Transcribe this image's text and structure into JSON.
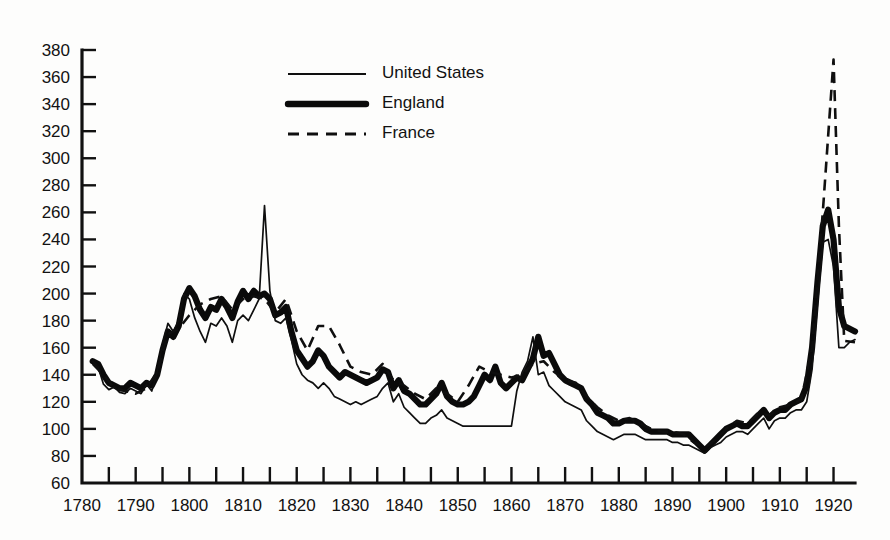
{
  "chart_data": {
    "type": "line",
    "title": "",
    "subtitle": "",
    "xlabel": "",
    "ylabel": "",
    "xlim": [
      1780,
      1924
    ],
    "ylim": [
      60,
      380
    ],
    "ytick_step": 20,
    "xtick_minor_step": 5,
    "xtick_major_step": 10,
    "grid": false,
    "legend_position": "top-center",
    "ytick_labels": [
      "380",
      "360",
      "340",
      "320",
      "300",
      "280",
      "260",
      "240",
      "220",
      "200",
      "180",
      "160",
      "140",
      "120",
      "100",
      "80",
      "60"
    ],
    "ytick_values": [
      380,
      360,
      340,
      320,
      300,
      280,
      260,
      240,
      220,
      200,
      180,
      160,
      140,
      120,
      100,
      80,
      60
    ],
    "xtick_labels": [
      "1780",
      "1790",
      "1800",
      "1810",
      "1820",
      "1830",
      "1840",
      "1850",
      "1860",
      "1870",
      "1880",
      "1890",
      "1900",
      "1910",
      "1920"
    ],
    "xtick_values": [
      1780,
      1790,
      1800,
      1810,
      1820,
      1830,
      1840,
      1850,
      1860,
      1870,
      1880,
      1890,
      1900,
      1910,
      1920
    ],
    "xtick_minor_values": [
      1785,
      1795,
      1805,
      1815,
      1825,
      1835,
      1845,
      1855,
      1865,
      1875,
      1885,
      1895,
      1905,
      1915
    ],
    "series": [
      {
        "name": "United States",
        "style": "thin-solid",
        "color": "#0f0f0f",
        "x": [
          1782,
          1783,
          1784,
          1785,
          1786,
          1787,
          1788,
          1789,
          1790,
          1791,
          1792,
          1793,
          1794,
          1795,
          1796,
          1797,
          1798,
          1799,
          1800,
          1801,
          1802,
          1803,
          1804,
          1805,
          1806,
          1807,
          1808,
          1809,
          1810,
          1811,
          1812,
          1813,
          1814,
          1815,
          1816,
          1817,
          1818,
          1819,
          1820,
          1821,
          1822,
          1823,
          1824,
          1825,
          1826,
          1827,
          1828,
          1829,
          1830,
          1831,
          1832,
          1833,
          1834,
          1835,
          1836,
          1837,
          1838,
          1839,
          1840,
          1841,
          1842,
          1843,
          1844,
          1845,
          1846,
          1847,
          1848,
          1849,
          1850,
          1851,
          1852,
          1853,
          1854,
          1855,
          1856,
          1857,
          1858,
          1859,
          1860,
          1861,
          1862,
          1863,
          1864,
          1865,
          1866,
          1867,
          1868,
          1869,
          1870,
          1871,
          1872,
          1873,
          1874,
          1875,
          1876,
          1877,
          1878,
          1879,
          1880,
          1881,
          1882,
          1883,
          1884,
          1885,
          1886,
          1887,
          1888,
          1889,
          1890,
          1891,
          1892,
          1893,
          1894,
          1895,
          1896,
          1897,
          1898,
          1899,
          1900,
          1901,
          1902,
          1903,
          1904,
          1905,
          1906,
          1907,
          1908,
          1909,
          1910,
          1911,
          1912,
          1913,
          1914,
          1915,
          1916,
          1917,
          1918,
          1919,
          1920,
          1921,
          1922,
          1923,
          1924
        ],
        "y": [
          150,
          146,
          133,
          129,
          131,
          127,
          126,
          130,
          128,
          126,
          133,
          128,
          142,
          162,
          178,
          172,
          180,
          200,
          196,
          182,
          172,
          164,
          178,
          176,
          182,
          176,
          164,
          180,
          184,
          180,
          188,
          196,
          265,
          202,
          180,
          178,
          182,
          166,
          148,
          140,
          136,
          134,
          130,
          134,
          130,
          124,
          122,
          120,
          118,
          120,
          118,
          120,
          122,
          124,
          130,
          134,
          120,
          126,
          116,
          112,
          108,
          104,
          104,
          108,
          110,
          114,
          108,
          106,
          104,
          102,
          102,
          102,
          102,
          102,
          102,
          102,
          102,
          102,
          102,
          128,
          142,
          150,
          168,
          140,
          142,
          132,
          128,
          124,
          120,
          118,
          116,
          114,
          106,
          102,
          98,
          96,
          94,
          92,
          94,
          96,
          96,
          96,
          94,
          92,
          92,
          92,
          92,
          92,
          90,
          90,
          88,
          88,
          86,
          84,
          82,
          86,
          88,
          90,
          94,
          96,
          98,
          98,
          96,
          100,
          104,
          108,
          100,
          106,
          108,
          108,
          112,
          114,
          114,
          120,
          144,
          192,
          238,
          240,
          220,
          160,
          160,
          164,
          166
        ]
      },
      {
        "name": "England",
        "style": "thick-solid",
        "color": "#0a0a0a",
        "x": [
          1782,
          1783,
          1784,
          1785,
          1786,
          1787,
          1788,
          1789,
          1790,
          1791,
          1792,
          1793,
          1794,
          1795,
          1796,
          1797,
          1798,
          1799,
          1800,
          1801,
          1802,
          1803,
          1804,
          1805,
          1806,
          1807,
          1808,
          1809,
          1810,
          1811,
          1812,
          1813,
          1814,
          1815,
          1816,
          1817,
          1818,
          1819,
          1820,
          1821,
          1822,
          1823,
          1824,
          1825,
          1826,
          1827,
          1828,
          1829,
          1830,
          1831,
          1832,
          1833,
          1834,
          1835,
          1836,
          1837,
          1838,
          1839,
          1840,
          1841,
          1842,
          1843,
          1844,
          1845,
          1846,
          1847,
          1848,
          1849,
          1850,
          1851,
          1852,
          1853,
          1854,
          1855,
          1856,
          1857,
          1858,
          1859,
          1860,
          1861,
          1862,
          1863,
          1864,
          1865,
          1866,
          1867,
          1868,
          1869,
          1870,
          1871,
          1872,
          1873,
          1874,
          1875,
          1876,
          1877,
          1878,
          1879,
          1880,
          1881,
          1882,
          1883,
          1884,
          1885,
          1886,
          1887,
          1888,
          1889,
          1890,
          1891,
          1892,
          1893,
          1894,
          1895,
          1896,
          1897,
          1898,
          1899,
          1900,
          1901,
          1902,
          1903,
          1904,
          1905,
          1906,
          1907,
          1908,
          1909,
          1910,
          1911,
          1912,
          1913,
          1914,
          1915,
          1916,
          1917,
          1918,
          1919,
          1920,
          1921,
          1922,
          1923,
          1924
        ],
        "y": [
          150,
          148,
          140,
          134,
          132,
          130,
          130,
          134,
          132,
          130,
          134,
          132,
          140,
          158,
          172,
          168,
          176,
          196,
          204,
          198,
          188,
          182,
          190,
          188,
          196,
          190,
          182,
          194,
          202,
          196,
          202,
          198,
          200,
          196,
          184,
          186,
          190,
          172,
          158,
          152,
          146,
          150,
          158,
          154,
          146,
          142,
          138,
          142,
          140,
          138,
          136,
          134,
          136,
          138,
          144,
          142,
          130,
          136,
          128,
          126,
          122,
          118,
          118,
          122,
          126,
          134,
          124,
          120,
          118,
          118,
          120,
          124,
          132,
          140,
          136,
          146,
          134,
          130,
          134,
          138,
          136,
          144,
          152,
          168,
          154,
          156,
          148,
          140,
          136,
          134,
          132,
          130,
          122,
          118,
          112,
          110,
          108,
          104,
          104,
          106,
          106,
          106,
          104,
          100,
          98,
          98,
          98,
          98,
          96,
          96,
          96,
          96,
          92,
          88,
          84,
          88,
          92,
          96,
          100,
          102,
          104,
          102,
          102,
          106,
          110,
          114,
          108,
          112,
          114,
          114,
          118,
          120,
          122,
          132,
          160,
          208,
          250,
          262,
          240,
          190,
          176,
          174,
          172
        ]
      },
      {
        "name": "France",
        "style": "dashed",
        "color": "#0f0f0f",
        "x": [
          1782,
          1784,
          1786,
          1788,
          1790,
          1792,
          1794,
          1796,
          1798,
          1800,
          1802,
          1804,
          1806,
          1808,
          1810,
          1812,
          1814,
          1816,
          1818,
          1820,
          1822,
          1824,
          1826,
          1828,
          1830,
          1832,
          1834,
          1836,
          1838,
          1840,
          1842,
          1844,
          1846,
          1848,
          1850,
          1852,
          1854,
          1856,
          1858,
          1860,
          1862,
          1864,
          1866,
          1868,
          1870,
          1872,
          1874,
          1876,
          1878,
          1880,
          1882,
          1884,
          1886,
          1888,
          1890,
          1892,
          1894,
          1896,
          1898,
          1900,
          1902,
          1904,
          1906,
          1908,
          1910,
          1912,
          1914,
          1916,
          1918,
          1920,
          1921,
          1922,
          1924
        ],
        "y": [
          148,
          140,
          130,
          128,
          126,
          130,
          142,
          170,
          174,
          184,
          192,
          196,
          198,
          188,
          196,
          198,
          196,
          186,
          196,
          172,
          158,
          176,
          176,
          162,
          146,
          142,
          140,
          148,
          136,
          132,
          126,
          122,
          130,
          126,
          120,
          132,
          146,
          142,
          140,
          138,
          140,
          148,
          150,
          142,
          136,
          134,
          124,
          116,
          110,
          106,
          108,
          104,
          100,
          98,
          98,
          96,
          90,
          86,
          92,
          100,
          106,
          104,
          112,
          110,
          116,
          118,
          122,
          160,
          260,
          373,
          250,
          165,
          164
        ]
      }
    ],
    "annotations": [
      {
        "label": "US peak 1814",
        "x": 1814,
        "y": 265
      },
      {
        "label": "France WWI peak",
        "x": 1920,
        "y": 373
      },
      {
        "label": "England WWI peak",
        "x": 1919,
        "y": 262
      },
      {
        "label": "trough 1896",
        "x": 1896,
        "y": 82
      }
    ]
  },
  "legend": {
    "items": [
      {
        "label": "United States",
        "style": "thin-solid"
      },
      {
        "label": "England",
        "style": "thick-solid"
      },
      {
        "label": "France",
        "style": "dashed"
      }
    ]
  },
  "colors": {
    "ink": "#111111",
    "background": "#fdfdfc"
  }
}
